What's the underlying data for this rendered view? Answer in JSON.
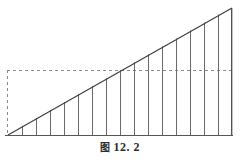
{
  "figure": {
    "caption_label": "图",
    "caption_number": "12. 2",
    "caption_full": "图 12. 2",
    "type": "geometry-diagram",
    "colors": {
      "background": "#ffffff",
      "stroke": "#4a4a4a",
      "hypotenuse": "#3a3a3a",
      "baseline": "#555555",
      "dashed": "#7a7a7a",
      "caption_text": "#2b2b2b"
    },
    "geometry": {
      "baseline_y": 135,
      "apex_x": 232,
      "apex_y": 8,
      "origin_x": 8,
      "origin_y": 135,
      "right_edge_x": 232,
      "dashed_horizontal_y": 70,
      "dashed_horizontal_x1": 7,
      "dashed_horizontal_x2": 232,
      "dashed_vertical_x": 7,
      "dashed_vertical_y1": 70,
      "dashed_vertical_y2": 135,
      "strip_count": 16,
      "strip_first_x": 22,
      "strip_spacing": 14,
      "strip_x_positions": [
        22,
        36,
        50,
        64,
        78,
        92,
        106,
        120,
        134,
        148,
        162,
        176,
        190,
        204,
        218,
        232
      ]
    },
    "elements": {
      "hypotenuse_name": "hypotenuse-line",
      "baseline_name": "baseline-axis",
      "right_edge_name": "right-vertical-edge",
      "dashed_h_name": "dashed-horizontal-reference-line",
      "dashed_v_name": "dashed-vertical-reference-line",
      "strips_name": "rectangle-strips-group"
    }
  }
}
